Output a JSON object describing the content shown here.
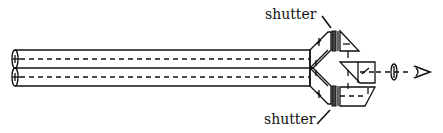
{
  "diagram": {
    "type": "optical-schematic",
    "labels": {
      "shutter_top": "shutter",
      "shutter_bottom": "shutter"
    },
    "components": [
      {
        "name": "upper-tube",
        "kind": "tube"
      },
      {
        "name": "lower-tube",
        "kind": "tube"
      },
      {
        "name": "upper-periscope-prism",
        "kind": "prism"
      },
      {
        "name": "lower-periscope-prism",
        "kind": "prism"
      },
      {
        "name": "upper-shutter",
        "kind": "shutter"
      },
      {
        "name": "lower-shutter",
        "kind": "shutter"
      },
      {
        "name": "upper-right-angle-prism",
        "kind": "prism"
      },
      {
        "name": "beam-combiner-prism",
        "kind": "prism"
      },
      {
        "name": "lower-right-prism",
        "kind": "prism"
      },
      {
        "name": "eyepiece-lens",
        "kind": "lens"
      },
      {
        "name": "eye",
        "kind": "observer"
      }
    ],
    "colors": {
      "ink": "#111111",
      "background": "#ffffff"
    }
  }
}
